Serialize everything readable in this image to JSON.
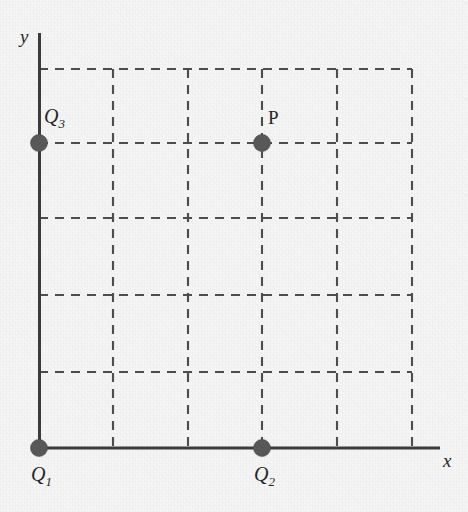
{
  "figure": {
    "type": "coordinate-diagram",
    "background_color": "#f5f5f5",
    "ink_color": "#3b3b3b",
    "dot_color": "#58585a",
    "grid_color": "#4d4d4d"
  },
  "axes": {
    "x_label": "x",
    "y_label": "y",
    "origin_px": {
      "x": 39,
      "y": 448
    },
    "x_axis_end_px": {
      "x": 440,
      "y": 448
    },
    "y_axis_end_px": {
      "x": 39,
      "y": 33
    },
    "grid": {
      "visible": true,
      "style": "dashed",
      "cell_size_px": 75,
      "vertical_lines_px": [
        113,
        188,
        262,
        337,
        412
      ],
      "horizontal_lines_px": [
        372,
        295,
        218,
        143,
        69
      ],
      "columns": 5,
      "rows": 5
    }
  },
  "points": [
    {
      "id": "Q1",
      "label": "Q",
      "subscript": "1",
      "label_style": "italic",
      "grid_position": {
        "x": 0,
        "y": 0
      },
      "pixel_position": {
        "x": 39,
        "y": 448
      },
      "label_pixel_position": {
        "x": 40,
        "y": 468
      },
      "label_placement": "below"
    },
    {
      "id": "Q2",
      "label": "Q",
      "subscript": "2",
      "label_style": "italic",
      "grid_position": {
        "x": 3,
        "y": 0
      },
      "pixel_position": {
        "x": 262,
        "y": 448
      },
      "label_pixel_position": {
        "x": 263,
        "y": 468
      },
      "label_placement": "below"
    },
    {
      "id": "Q3",
      "label": "Q",
      "subscript": "3",
      "label_style": "italic",
      "grid_position": {
        "x": 0,
        "y": 4
      },
      "pixel_position": {
        "x": 39,
        "y": 143
      },
      "label_pixel_position": {
        "x": 46,
        "y": 112
      },
      "label_placement": "above-right"
    },
    {
      "id": "P",
      "label": "P",
      "subscript": "",
      "label_style": "upright",
      "grid_position": {
        "x": 3,
        "y": 4
      },
      "pixel_position": {
        "x": 262,
        "y": 143
      },
      "label_pixel_position": {
        "x": 271,
        "y": 113
      },
      "label_placement": "above-right"
    }
  ],
  "dot_radius_px": 8.5
}
